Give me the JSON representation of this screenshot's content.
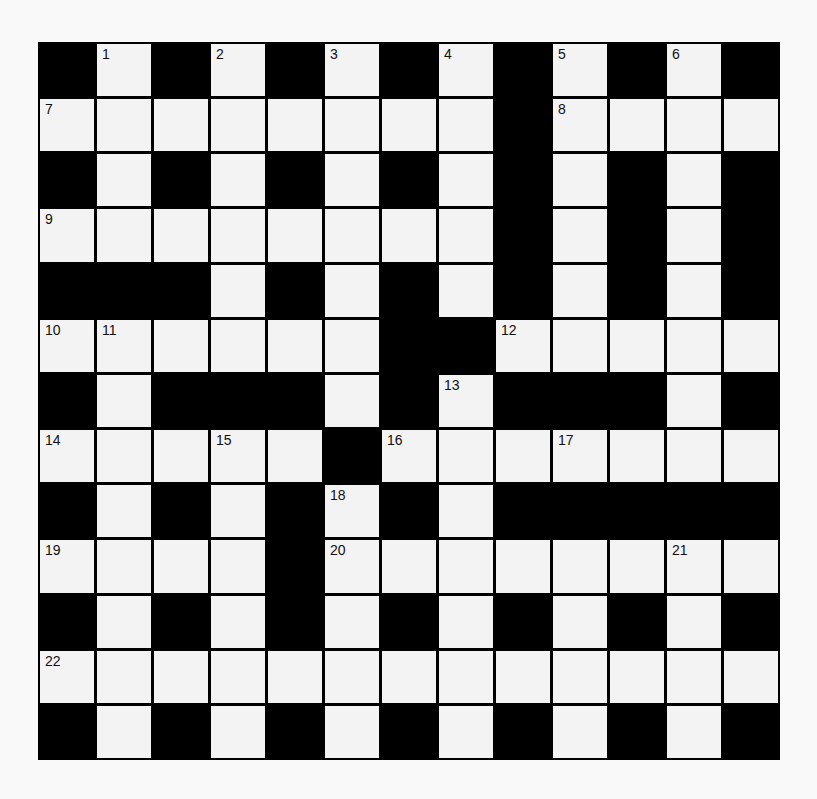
{
  "puzzle": {
    "rows": 13,
    "cols": 13,
    "grid": [
      "#.#.#.#.#.#.#",
      "........#....",
      "#.#.#.#.#.#.#",
      "........#.#.#",
      "###.#.#.#.#.#",
      "......##.....",
      "#.###.#.###.#",
      ".....#.......",
      "#.#.#.#.#####",
      "....#........",
      "#.#.#.#.#.#.#",
      ".............",
      "#.#.#.#.#.#.#"
    ],
    "numbers": [
      {
        "r": 0,
        "c": 1,
        "n": "1"
      },
      {
        "r": 0,
        "c": 3,
        "n": "2"
      },
      {
        "r": 0,
        "c": 5,
        "n": "3"
      },
      {
        "r": 0,
        "c": 7,
        "n": "4"
      },
      {
        "r": 0,
        "c": 9,
        "n": "5"
      },
      {
        "r": 0,
        "c": 11,
        "n": "6"
      },
      {
        "r": 1,
        "c": 0,
        "n": "7"
      },
      {
        "r": 1,
        "c": 9,
        "n": "8"
      },
      {
        "r": 3,
        "c": 0,
        "n": "9"
      },
      {
        "r": 5,
        "c": 0,
        "n": "10"
      },
      {
        "r": 5,
        "c": 1,
        "n": "11"
      },
      {
        "r": 5,
        "c": 8,
        "n": "12"
      },
      {
        "r": 6,
        "c": 7,
        "n": "13"
      },
      {
        "r": 7,
        "c": 0,
        "n": "14"
      },
      {
        "r": 7,
        "c": 3,
        "n": "15"
      },
      {
        "r": 7,
        "c": 6,
        "n": "16"
      },
      {
        "r": 7,
        "c": 9,
        "n": "17"
      },
      {
        "r": 8,
        "c": 5,
        "n": "18"
      },
      {
        "r": 9,
        "c": 0,
        "n": "19"
      },
      {
        "r": 9,
        "c": 5,
        "n": "20"
      },
      {
        "r": 9,
        "c": 11,
        "n": "21"
      },
      {
        "r": 11,
        "c": 0,
        "n": "22"
      }
    ]
  },
  "colors": {
    "block": "#000000",
    "cell": "#f3f3f3",
    "background": "#f9f9f9"
  }
}
